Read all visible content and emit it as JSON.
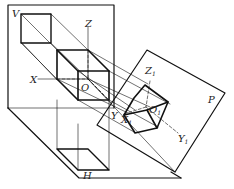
{
  "diagram": {
    "type": "projection-schematic",
    "planes": {
      "V": "V",
      "H": "H",
      "P": "P"
    },
    "axes": {
      "x": "X",
      "y": "Y",
      "z": "Z",
      "origin": "O"
    },
    "projected_axes": {
      "x1": "X",
      "y1": "Y",
      "z1": "Z",
      "o1": "O",
      "subscript": "1"
    },
    "colors": {
      "line": "#111111",
      "background": "#ffffff"
    }
  }
}
